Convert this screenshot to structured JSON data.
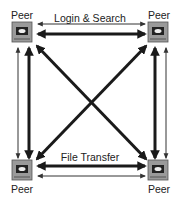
{
  "diagram": {
    "type": "peer-to-peer network",
    "nodes": [
      {
        "id": "tl",
        "label": "Peer"
      },
      {
        "id": "tr",
        "label": "Peer"
      },
      {
        "id": "bl",
        "label": "Peer"
      },
      {
        "id": "br",
        "label": "Peer"
      }
    ],
    "edge_labels": {
      "top": "Login & Search",
      "bottom": "File Transfer"
    },
    "colors": {
      "arrow": "#1a1a1a",
      "thin_arrow": "#333333",
      "computer": "#8a8a8a"
    }
  }
}
